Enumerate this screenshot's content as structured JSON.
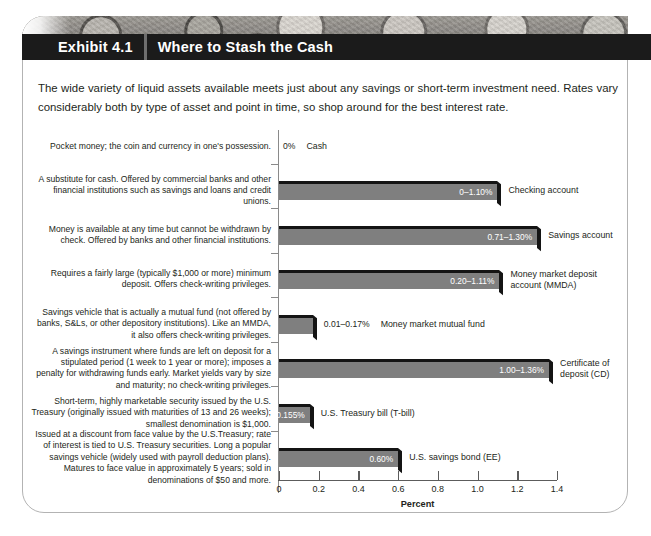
{
  "header": {
    "exhibit_number": "Exhibit 4.1",
    "exhibit_title": "Where to Stash the Cash",
    "banner_color": "#1b1b1b",
    "banner_image": "coins-photo"
  },
  "intro": {
    "text": "The wide variety of liquid assets available meets just about any savings or short-term investment need. Rates vary considerably both by type of asset and point in time, so shop around for the best interest rate."
  },
  "chart_data": {
    "type": "bar",
    "orientation": "horizontal",
    "title": "Where to Stash the Cash",
    "xlabel": "Percent",
    "ylabel": "",
    "xlim": [
      0,
      1.4
    ],
    "xticks": [
      "0",
      "0.2",
      "0.4",
      "0.6",
      "0.8",
      "1.0",
      "1.2",
      "1.4"
    ],
    "xtick_values": [
      0,
      0.2,
      0.4,
      0.6,
      0.8,
      1.0,
      1.2,
      1.4
    ],
    "grid": false,
    "legend": "none",
    "bar_color": "#7f7f7f",
    "bar_edge_color": "#141414",
    "categories": [
      "Cash",
      "Checking account",
      "Savings account",
      "Money market deposit account (MMDA)",
      "Money market mutual fund",
      "Certificate of deposit (CD)",
      "U.S. Treasury bill (T-bill)",
      "U.S. savings bond (EE)"
    ],
    "values": [
      0,
      1.1,
      1.3,
      1.11,
      0.17,
      1.36,
      0.155,
      0.6
    ],
    "value_labels": [
      "0%",
      "0–1.10%",
      "0.71–1.30%",
      "0.20–1.11%",
      "0.01–0.17%",
      "1.00–1.36%",
      "0.155%",
      "0.60%"
    ],
    "rows": [
      {
        "category": "Cash",
        "category_display": "Cash",
        "description": "Pocket money; the coin and currency in one's possession.",
        "value": 0,
        "value_label": "0%",
        "label_inside": false
      },
      {
        "category": "Checking account",
        "category_display": "Checking account",
        "description": "A substitute for cash. Offered by commercial banks and other financial institutions such as savings and loans and credit unions.",
        "value": 1.1,
        "value_label": "0–1.10%",
        "label_inside": true
      },
      {
        "category": "Savings account",
        "category_display": "Savings account",
        "description": "Money is available at any time but cannot be withdrawn by check. Offered by banks and other financial institutions.",
        "value": 1.3,
        "value_label": "0.71–1.30%",
        "label_inside": true
      },
      {
        "category": "Money market deposit account (MMDA)",
        "category_display": "Money market deposit\naccount (MMDA)",
        "description": "Requires a fairly large (typically $1,000 or more) minimum deposit. Offers check-writing privileges.",
        "value": 1.11,
        "value_label": "0.20–1.11%",
        "label_inside": true
      },
      {
        "category": "Money market mutual fund",
        "category_display": "Money market mutual fund",
        "description": "Savings vehicle that is actually a mutual fund (not offered by banks, S&Ls, or other depository institutions). Like an MMDA, it also offers check-writing privileges.",
        "value": 0.17,
        "value_label": "0.01–0.17%",
        "label_inside": false
      },
      {
        "category": "Certificate of deposit (CD)",
        "category_display": "Certificate of\ndeposit (CD)",
        "description": "A savings instrument where funds are left on deposit for a stipulated period (1 week to 1 year or more); imposes a penalty for withdrawing funds early. Market yields vary by size and maturity; no check-writing privileges.",
        "value": 1.36,
        "value_label": "1.00–1.36%",
        "label_inside": true
      },
      {
        "category": "U.S. Treasury bill (T-bill)",
        "category_display": "U.S. Treasury bill (T-bill)",
        "description": "Short-term, highly marketable security issued by the U.S. Treasury (originally issued with maturities of 13 and 26 weeks); smallest denomination is $1,000.",
        "value": 0.155,
        "value_label": "0.155%",
        "label_inside": true
      },
      {
        "category": "U.S. savings bond (EE)",
        "category_display": "U.S. savings bond (EE)",
        "description": "Issued at a discount from face value by the U.S.Treasury; rate of interest is tied to U.S. Treasury securities. Long a popular savings vehicle (widely used with payroll deduction plans). Matures to face value in approximately 5 years; sold in denominations of $50 and more.",
        "value": 0.6,
        "value_label": "0.60%",
        "label_inside": true
      }
    ]
  }
}
